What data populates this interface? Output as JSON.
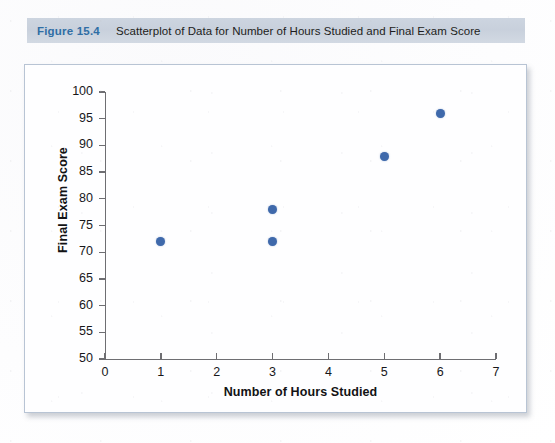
{
  "figure": {
    "number_label": "Figure 15.4",
    "caption": "Scatterplot of Data for Number of Hours Studied and Final Exam Score",
    "accent_color": "#2f6ea5",
    "caption_bar_color": "#cdd5e0"
  },
  "chart_data": {
    "type": "scatter",
    "title": "",
    "xlabel": "Number of Hours Studied",
    "ylabel": "Final Exam Score",
    "xlim": [
      0,
      7
    ],
    "ylim": [
      50,
      100
    ],
    "xticks": [
      0,
      1,
      2,
      3,
      4,
      5,
      6,
      7
    ],
    "yticks": [
      50,
      55,
      60,
      65,
      70,
      75,
      80,
      85,
      90,
      95,
      100
    ],
    "xtick_labels": [
      "0",
      "1",
      "2",
      "3",
      "4",
      "5",
      "6",
      "7"
    ],
    "ytick_labels": [
      "50",
      "55",
      "60",
      "65",
      "70",
      "75",
      "80",
      "85",
      "90",
      "95",
      "100"
    ],
    "grid": false,
    "legend": null,
    "marker_color": "#3f69ab",
    "marker_size": 9,
    "points": [
      {
        "x": 1,
        "y": 72
      },
      {
        "x": 3,
        "y": 78
      },
      {
        "x": 3,
        "y": 72
      },
      {
        "x": 5,
        "y": 88
      },
      {
        "x": 6,
        "y": 96
      }
    ],
    "series": [
      {
        "name": "Students",
        "x": [
          1,
          3,
          3,
          5,
          6
        ],
        "y": [
          72,
          78,
          72,
          88,
          96
        ]
      }
    ]
  }
}
